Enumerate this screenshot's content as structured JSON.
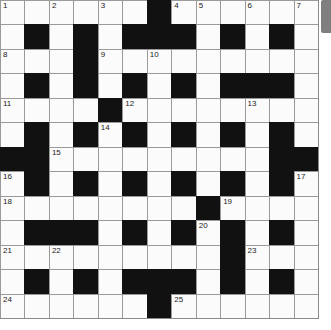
{
  "puzzle": {
    "rows": 13,
    "cols": 13,
    "layout": [
      "......#......",
      ".#.#.###.#.#.",
      "...#.........",
      ".#.#.#.#.###.",
      "....#........",
      ".#.#.#.#.#.#.",
      "##.........##",
      ".#.#.#.#.#.#.",
      "........#....",
      ".###.#.#.#.#.",
      ".........#...",
      ".#.#.###.#.#.",
      "......#......"
    ],
    "numbers": [
      {
        "r": 0,
        "c": 0,
        "n": "1"
      },
      {
        "r": 0,
        "c": 2,
        "n": "2"
      },
      {
        "r": 0,
        "c": 4,
        "n": "3"
      },
      {
        "r": 0,
        "c": 7,
        "n": "4"
      },
      {
        "r": 0,
        "c": 8,
        "n": "5"
      },
      {
        "r": 0,
        "c": 10,
        "n": "6"
      },
      {
        "r": 0,
        "c": 12,
        "n": "7"
      },
      {
        "r": 2,
        "c": 0,
        "n": "8"
      },
      {
        "r": 2,
        "c": 4,
        "n": "9"
      },
      {
        "r": 2,
        "c": 6,
        "n": "10"
      },
      {
        "r": 4,
        "c": 0,
        "n": "11"
      },
      {
        "r": 4,
        "c": 5,
        "n": "12"
      },
      {
        "r": 4,
        "c": 10,
        "n": "13"
      },
      {
        "r": 5,
        "c": 4,
        "n": "14"
      },
      {
        "r": 6,
        "c": 2,
        "n": "15"
      },
      {
        "r": 7,
        "c": 0,
        "n": "16"
      },
      {
        "r": 7,
        "c": 12,
        "n": "17"
      },
      {
        "r": 8,
        "c": 0,
        "n": "18"
      },
      {
        "r": 8,
        "c": 9,
        "n": "19"
      },
      {
        "r": 9,
        "c": 8,
        "n": "20"
      },
      {
        "r": 10,
        "c": 0,
        "n": "21"
      },
      {
        "r": 10,
        "c": 2,
        "n": "22"
      },
      {
        "r": 10,
        "c": 10,
        "n": "23"
      },
      {
        "r": 12,
        "c": 0,
        "n": "24"
      },
      {
        "r": 12,
        "c": 7,
        "n": "25"
      }
    ]
  },
  "side_tab": {
    "label": ""
  },
  "colors": {
    "black_cell": "#111111",
    "white_cell": "#fbfbfb",
    "grid_line": "#9a9a9a",
    "tab": "#7f7f7f"
  }
}
